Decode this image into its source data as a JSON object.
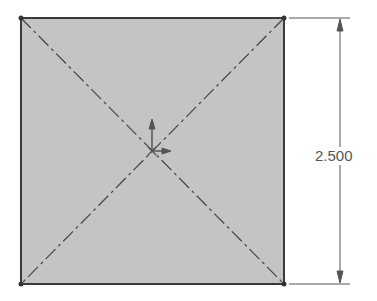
{
  "sketch": {
    "shape": "square",
    "fill_color": "#c4c4c4",
    "edge_color": "#3a3a3a",
    "construction_lines": "diagonal centerlines",
    "origin_icon": "origin-axes-icon"
  },
  "dimension": {
    "orientation": "vertical",
    "value": "2.500"
  }
}
